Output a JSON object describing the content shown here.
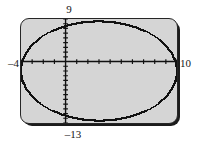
{
  "screen": {
    "device": "graphing-calculator",
    "background_color": "#d5d5d5",
    "border_color": "#262626",
    "curve_color": "#111111",
    "axis_color": "#111111"
  },
  "labels": {
    "xmin": "–4",
    "xmax": "10",
    "ymax": "9",
    "ymin": "–13"
  },
  "chart_data": {
    "type": "line",
    "title": "",
    "xlabel": "",
    "ylabel": "",
    "grid": false,
    "legend": null,
    "xlim": [
      -4,
      10
    ],
    "ylim": [
      -13,
      9
    ],
    "xtick_step": 1,
    "ytick_step": 1,
    "tick_labels_shown": false,
    "annotations": [
      {
        "text": "9",
        "position": "top",
        "meaning": "Ymax"
      },
      {
        "text": "–13",
        "position": "bottom",
        "meaning": "Ymin"
      },
      {
        "text": "–4",
        "position": "left",
        "meaning": "Xmin"
      },
      {
        "text": "10",
        "position": "right",
        "meaning": "Xmax"
      }
    ],
    "series": [
      {
        "name": "ellipse",
        "shape": "ellipse",
        "center": [
          3,
          -2
        ],
        "semi_axis_x": 7,
        "semi_axis_y": 10.5,
        "rendering": "pixelated-stairstep",
        "closed": true
      }
    ]
  }
}
